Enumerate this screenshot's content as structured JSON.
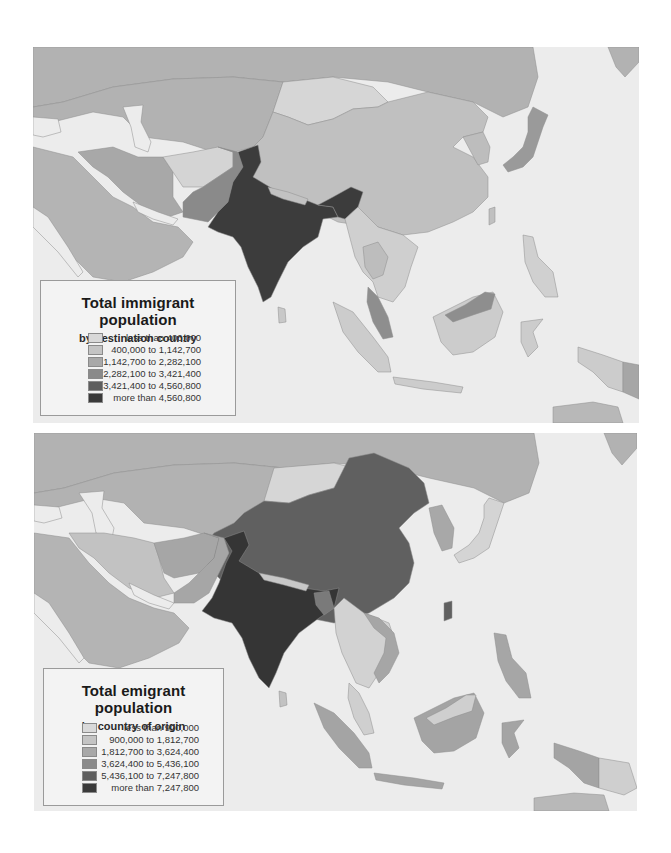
{
  "chart_data": [
    {
      "type": "choropleth-map",
      "region": "Asia (Middle East, Central, South, East and Southeast Asia)",
      "title": "Total immigrant population",
      "subtitle": "by destination country",
      "legend": {
        "title": "Total immigrant population",
        "subtitle": "by destination country",
        "position": "bottom-left",
        "classes": [
          {
            "label": "less than 400,000",
            "min": 0,
            "max": 400000,
            "color": "#d9d9d9"
          },
          {
            "label": "400,000 to 1,142,700",
            "min": 400000,
            "max": 1142700,
            "color": "#c4c4c4"
          },
          {
            "label": "1,142,700 to 2,282,100",
            "min": 1142700,
            "max": 2282100,
            "color": "#a8a8a8"
          },
          {
            "label": "2,282,100 to 3,421,400",
            "min": 2282100,
            "max": 3421400,
            "color": "#8a8a8a"
          },
          {
            "label": "3,421,400 to 4,560,800",
            "min": 3421400,
            "max": 4560800,
            "color": "#5e5e5e"
          },
          {
            "label": "more than 4,560,800",
            "min": 4560800,
            "max": null,
            "color": "#3a3a3a"
          }
        ]
      },
      "country_classes": {
        "India": "more than 4,560,800",
        "Bangladesh": "more than 4,560,800",
        "Pakistan": "2,282,100 to 3,421,400",
        "Iran": "1,142,700 to 2,282,100",
        "Japan": "1,142,700 to 2,282,100",
        "Malaysia": "1,142,700 to 2,282,100",
        "Russia": "1,142,700 to 2,282,100",
        "Kazakhstan": "1,142,700 to 2,282,100",
        "Saudi Arabia": "1,142,700 to 2,282,100",
        "China": "400,000 to 1,142,700",
        "Thailand": "400,000 to 1,142,700",
        "Afghanistan": "less than 400,000",
        "Mongolia": "less than 400,000",
        "Indonesia": "less than 400,000",
        "Philippines": "less than 400,000",
        "Vietnam": "less than 400,000",
        "Myanmar": "less than 400,000",
        "Korea": "400,000 to 1,142,700",
        "Papua New Guinea": "1,142,700 to 2,282,100",
        "Nepal": "400,000 to 1,142,700",
        "Sri Lanka": "less than 400,000"
      }
    },
    {
      "type": "choropleth-map",
      "region": "Asia (Middle East, Central, South, East and Southeast Asia)",
      "title": "Total emigrant population",
      "subtitle": "by country of origin",
      "legend": {
        "title": "Total emigrant population",
        "subtitle": "by country of origin",
        "position": "bottom-left",
        "classes": [
          {
            "label": "less than 900,000",
            "min": 0,
            "max": 900000,
            "color": "#d9d9d9"
          },
          {
            "label": "900,000 to 1,812,700",
            "min": 900000,
            "max": 1812700,
            "color": "#c4c4c4"
          },
          {
            "label": "1,812,700 to 3,624,400",
            "min": 1812700,
            "max": 3624400,
            "color": "#a8a8a8"
          },
          {
            "label": "3,624,400 to 5,436,100",
            "min": 3624400,
            "max": 5436100,
            "color": "#8a8a8a"
          },
          {
            "label": "5,436,100 to 7,247,800",
            "min": 5436100,
            "max": 7247800,
            "color": "#5e5e5e"
          },
          {
            "label": "more than 7,247,800",
            "min": 7247800,
            "max": null,
            "color": "#3a3a3a"
          }
        ]
      },
      "country_classes": {
        "India": "more than 7,247,800",
        "China": "5,436,100 to 7,247,800",
        "Bangladesh": "3,624,400 to 5,436,100",
        "Pakistan": "1,812,700 to 3,624,400",
        "Afghanistan": "1,812,700 to 3,624,400",
        "Indonesia": "1,812,700 to 3,624,400",
        "Philippines": "1,812,700 to 3,624,400",
        "Vietnam": "1,812,700 to 3,624,400",
        "Russia": "1,812,700 to 3,624,400",
        "Kazakhstan": "1,812,700 to 3,624,400",
        "Korea": "1,812,700 to 3,624,400",
        "Iran": "900,000 to 1,812,700",
        "Japan": "less than 900,000",
        "Mongolia": "less than 900,000",
        "Malaysia": "less than 900,000",
        "Thailand": "less than 900,000",
        "Myanmar": "less than 900,000",
        "Papua New Guinea": "less than 900,000",
        "Saudi Arabia": "less than 900,000",
        "Nepal": "less than 900,000",
        "Sri Lanka": "900,000 to 1,812,700"
      }
    }
  ],
  "maps": [
    {
      "legend": {
        "title": "Total immigrant population",
        "subtitle": "by destination country",
        "rows": [
          {
            "label": "less than 400,000",
            "color": "#d9d9d9"
          },
          {
            "label": "400,000 to 1,142,700",
            "color": "#c4c4c4"
          },
          {
            "label": "1,142,700 to 2,282,100",
            "color": "#a8a8a8"
          },
          {
            "label": "2,282,100 to 3,421,400",
            "color": "#8a8a8a"
          },
          {
            "label": "3,421,400 to 4,560,800",
            "color": "#5e5e5e"
          },
          {
            "label": "more than 4,560,800",
            "color": "#3a3a3a"
          }
        ]
      },
      "fills": {
        "sea": "#ececec",
        "russia": "#b2b2b2",
        "kazakhstan": "#b2b2b2",
        "mongolia": "#d6d6d6",
        "china": "#c0c0c0",
        "iran": "#a8a8a8",
        "afghanistan": "#d4d4d4",
        "pakistan": "#8a8a8a",
        "india": "#3c3c3c",
        "arabia": "#b4b4b4",
        "korea": "#bdbdbd",
        "japan": "#9a9a9a",
        "seasia_main": "#cfcfcf",
        "thailand": "#bdbdbd",
        "malaysia": "#8e8e8e",
        "indonesia": "#cccccc",
        "philippines": "#d0d0d0",
        "png": "#a6a6a6",
        "nepal": "#c2c2c2",
        "bangladesh": "#3c3c3c",
        "srilanka": "#c8c8c8",
        "australia": "#b8b8b8"
      }
    },
    {
      "legend": {
        "title": "Total emigrant population",
        "subtitle": "by country of origin",
        "rows": [
          {
            "label": "less than 900,000",
            "color": "#d9d9d9"
          },
          {
            "label": "900,000 to 1,812,700",
            "color": "#c4c4c4"
          },
          {
            "label": "1,812,700 to 3,624,400",
            "color": "#a8a8a8"
          },
          {
            "label": "3,624,400 to 5,436,100",
            "color": "#8a8a8a"
          },
          {
            "label": "5,436,100 to 7,247,800",
            "color": "#5e5e5e"
          },
          {
            "label": "more than 7,247,800",
            "color": "#3a3a3a"
          }
        ]
      },
      "fills": {
        "sea": "#ececec",
        "russia": "#b2b2b2",
        "kazakhstan": "#b2b2b2",
        "mongolia": "#d6d6d6",
        "china": "#606060",
        "iran": "#c2c2c2",
        "afghanistan": "#a6a6a6",
        "pakistan": "#a6a6a6",
        "india": "#353535",
        "arabia": "#b4b4b4",
        "korea": "#a8a8a8",
        "japan": "#d4d4d4",
        "seasia_main": "#d2d2d2",
        "thailand": "#d2d2d2",
        "malaysia": "#cfcfcf",
        "indonesia": "#a4a4a4",
        "philippines": "#a6a6a6",
        "png": "#cfcfcf",
        "nepal": "#c8c8c8",
        "bangladesh": "#7a7a7a",
        "srilanka": "#c2c2c2",
        "australia": "#b8b8b8"
      }
    }
  ]
}
